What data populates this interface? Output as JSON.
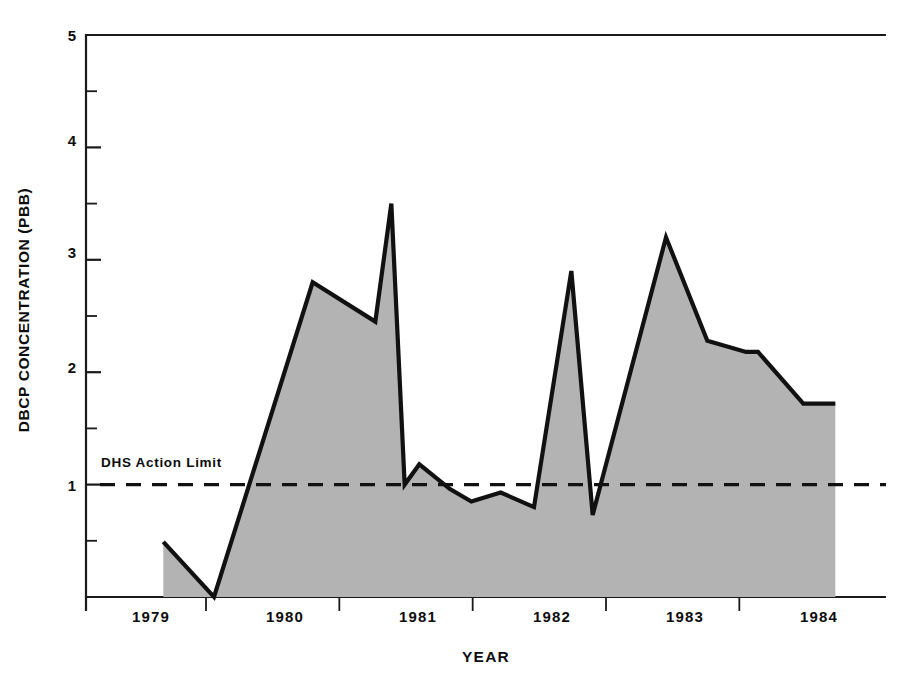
{
  "chart_data": {
    "type": "area",
    "title": "",
    "xlabel": "YEAR",
    "ylabel": "DBCP CONCENTRATION (PBB)",
    "xlim": [
      1978.6,
      1984.6
    ],
    "ylim": [
      0,
      5
    ],
    "grid": false,
    "legend": "none",
    "y_ticks_major": [
      "1",
      "2",
      "3",
      "4",
      "5"
    ],
    "y_tick_values": [
      1,
      2,
      3,
      4,
      5
    ],
    "y_minor_tick_values": [
      0.5,
      1.5,
      2.5,
      3.5,
      4.5
    ],
    "x_tick_labels": [
      "1979",
      "1980",
      "1981",
      "1982",
      "1983",
      "1984"
    ],
    "x_tick_label_values": [
      1979,
      1980,
      1981,
      1982,
      1983,
      1984
    ],
    "x_gridline_values": [
      1979.5,
      1980.5,
      1981.5,
      1982.5,
      1983.5
    ],
    "series": [
      {
        "name": "DBCP concentration",
        "fill": "#b3b3b3",
        "stroke": "#111111",
        "x": [
          1979.18,
          1979.56,
          1980.3,
          1980.77,
          1980.89,
          1980.99,
          1981.1,
          1981.33,
          1981.49,
          1981.71,
          1981.96,
          1982.24,
          1982.4,
          1982.95,
          1983.26,
          1983.55,
          1983.64,
          1983.98,
          1984.22
        ],
        "y": [
          0.49,
          0.0,
          2.8,
          2.45,
          3.5,
          1.0,
          1.18,
          0.96,
          0.85,
          0.93,
          0.8,
          2.9,
          0.73,
          3.2,
          2.28,
          2.18,
          2.18,
          1.72,
          1.72
        ]
      }
    ],
    "annotations": [
      {
        "text": "DHS Action Limit",
        "type": "threshold-line",
        "value": 1,
        "style": "dashed",
        "color": "#111111"
      }
    ]
  },
  "axes": {
    "y_label": "DBCP CONCENTRATION (PBB)",
    "x_label": "YEAR"
  },
  "y_ticks": [
    {
      "label": "5",
      "value": 5
    },
    {
      "label": "4",
      "value": 4
    },
    {
      "label": "3",
      "value": 3
    },
    {
      "label": "2",
      "value": 2
    },
    {
      "label": "1",
      "value": 1
    }
  ],
  "x_ticks": [
    {
      "label": "1979",
      "value": 1979
    },
    {
      "label": "1980",
      "value": 1980
    },
    {
      "label": "1981",
      "value": 1981
    },
    {
      "label": "1982",
      "value": 1982
    },
    {
      "label": "1983",
      "value": 1983
    },
    {
      "label": "1984",
      "value": 1984
    }
  ],
  "annotation": {
    "dhs_limit_label": "DHS Action Limit"
  },
  "colors": {
    "area_fill": "#b3b3b3",
    "line": "#111111",
    "axis": "#1a1a1a",
    "background": "#ffffff"
  }
}
